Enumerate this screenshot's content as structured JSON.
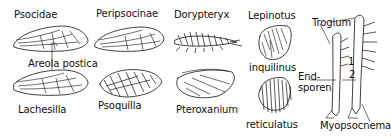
{
  "figure": {
    "labels": {
      "psocidae": "Psocidae",
      "peripsocinae": "Peripsocinae",
      "dorypteryx": "Dorypteryx",
      "lepinotus": "Lepinotus",
      "inquilinus": "inquilinus",
      "trogium": "Trogium",
      "areola_postica": "Areola postica",
      "lachesilla": "Lachesilla",
      "psoquilla": "Psoquilla",
      "pteroxanium": "Pteroxanium",
      "reticulatus": "reticulatus",
      "endsporen": "End-\nsporen",
      "endsporen_line1": "End-",
      "endsporen_line2": "sporen",
      "myopsocnema": "Myopsocnema",
      "marker_1": "1",
      "marker_2": "2"
    },
    "panels": [
      {
        "name": "Psocidae",
        "kind": "wing"
      },
      {
        "name": "Peripsocinae",
        "kind": "wing"
      },
      {
        "name": "Dorypteryx",
        "kind": "bristly wing"
      },
      {
        "name": "Lepinotus inquilinus",
        "kind": "scale wing"
      },
      {
        "name": "Lachesilla",
        "kind": "wing"
      },
      {
        "name": "Psoquilla",
        "kind": "patterned wing"
      },
      {
        "name": "Pteroxanium",
        "kind": "wing"
      },
      {
        "name": "reticulatus",
        "kind": "hairy wing"
      },
      {
        "name": "Trogium / Myopsocnema",
        "kind": "legs"
      }
    ]
  }
}
